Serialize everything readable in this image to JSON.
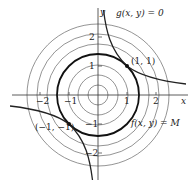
{
  "figure": {
    "origin_px": [
      98,
      95
    ],
    "unit_px": 29,
    "axes": {
      "x_label": "x",
      "y_label": "y",
      "x_ticks": [
        {
          "value": -2,
          "label": "−2"
        },
        {
          "value": -1,
          "label": "−1"
        },
        {
          "value": 1,
          "label": "1"
        },
        {
          "value": 2,
          "label": "2"
        }
      ],
      "y_ticks": [
        {
          "value": 2,
          "label": "2"
        },
        {
          "value": 1,
          "label": "1"
        },
        {
          "value": -1,
          "label": "−1"
        },
        {
          "value": -2,
          "label": "−2"
        }
      ]
    },
    "level_circles_radii": [
      0.35,
      0.7,
      1.05,
      1.76,
      2.11,
      2.46
    ],
    "constraint_circle_radius": 1.414,
    "labels": {
      "constraint": "g(x, y) = 0",
      "level_curve": "f(x, y) = M",
      "point_a": "(1, 1)",
      "point_b": "(−1, −1)"
    },
    "points": [
      {
        "x": 1,
        "y": 1
      },
      {
        "x": -1,
        "y": -1
      }
    ],
    "colors": {
      "thin": "#555555",
      "bold": "#111111",
      "axis": "#333333"
    }
  }
}
